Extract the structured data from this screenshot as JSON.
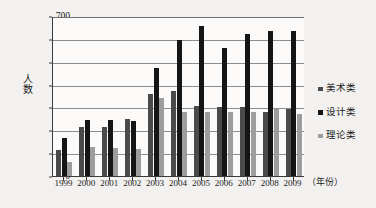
{
  "chart_data": {
    "type": "bar",
    "title": "",
    "xlabel": "（年份）",
    "ylabel": "人数",
    "categories": [
      "1999",
      "2000",
      "2001",
      "2002",
      "2003",
      "2004",
      "2005",
      "2006",
      "2007",
      "2008",
      "2009"
    ],
    "ylim": [
      0,
      700
    ],
    "yticks": [
      0,
      100,
      200,
      300,
      400,
      500,
      600,
      700
    ],
    "grid": true,
    "legend_position": "right",
    "series": [
      {
        "name": "美术类",
        "color": "#4a4a4a",
        "values": [
          112,
          215,
          216,
          248,
          358,
          370,
          305,
          303,
          303,
          280,
          295
        ]
      },
      {
        "name": "设计类",
        "color": "#151515",
        "values": [
          168,
          245,
          245,
          241,
          472,
          595,
          655,
          560,
          620,
          635,
          635
        ]
      },
      {
        "name": "理论类",
        "color": "#9d9d9d",
        "values": [
          62,
          125,
          124,
          120,
          342,
          282,
          281,
          281,
          281,
          295,
          270
        ]
      }
    ]
  },
  "legend": {
    "items": [
      {
        "label": "美术类"
      },
      {
        "label": "设计类"
      },
      {
        "label": "理论类"
      }
    ]
  },
  "axes": {
    "y_title": "人数",
    "x_title": "（年份）"
  }
}
